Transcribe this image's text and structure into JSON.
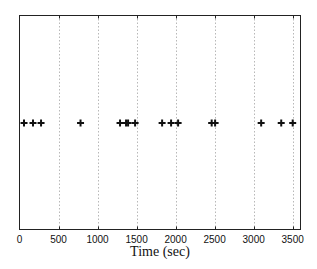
{
  "chart_data": {
    "type": "scatter",
    "title": "",
    "xlabel": "Time (sec)",
    "ylabel": "",
    "xlim": [
      0,
      3600
    ],
    "ylim": [
      0,
      2
    ],
    "grid": "vertical dotted at x ticks",
    "legend": null,
    "marker": "+",
    "x_ticks": [
      0,
      500,
      1000,
      1500,
      2000,
      2500,
      3000,
      3500
    ],
    "x_tick_labels": [
      "0",
      "500",
      "1000",
      "1500",
      "2000",
      "2500",
      "3000",
      "3500"
    ],
    "y_ticks": [],
    "series": [
      {
        "name": "events",
        "x": [
          58,
          173,
          276,
          782,
          1288,
          1365,
          1391,
          1481,
          1827,
          1942,
          2032,
          2462,
          2506,
          3096,
          3353,
          3500
        ],
        "y": [
          1,
          1,
          1,
          1,
          1,
          1,
          1,
          1,
          1,
          1,
          1,
          1,
          1,
          1,
          1,
          1
        ]
      }
    ]
  },
  "colors": {
    "axis": "#222222",
    "grid": "#999999",
    "marker": "#111111",
    "background": "#ffffff"
  }
}
